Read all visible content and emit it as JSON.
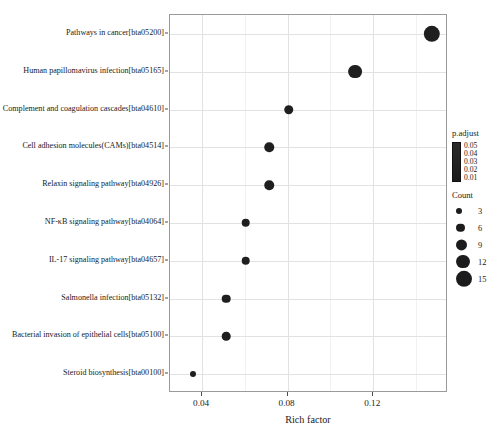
{
  "chart_data": {
    "type": "scatter",
    "title": "",
    "xlabel": "Rich factor",
    "ylabel": "",
    "xlim": [
      0.025,
      0.155
    ],
    "ylim": [
      0,
      11
    ],
    "grid": true,
    "legend_position": "right",
    "xticks": [
      0.04,
      0.08,
      0.12
    ],
    "xtick_labels": [
      "0.04",
      "0.08",
      "0.12"
    ],
    "categories": [
      "Pathways in cancer[bta05200]",
      "Human papillomavirus infection[bta05165]",
      "Complement and coagulation cascades[bta04610]",
      "Cell adhesion molecules(CAMs)[bta04514]",
      "Relaxin signaling pathway[bta04926]",
      "NF-κB signaling pathway[bta04064]",
      "IL-17 signaling pathway[bta04657]",
      "Salmonella infection[bta05132]",
      "Bacterial invasion of epithelial cells[bta05100]",
      "Steroid biosynthesis[bta00100]"
    ],
    "points": [
      {
        "category": "Pathways in cancer[bta05200]",
        "rich_factor": 0.1475,
        "count": 15,
        "p_adjust": 0.012
      },
      {
        "category": "Human papillomavirus infection[bta05165]",
        "rich_factor": 0.1115,
        "count": 12,
        "p_adjust": 0.018
      },
      {
        "category": "Complement and coagulation cascades[bta04610]",
        "rich_factor": 0.0805,
        "count": 7,
        "p_adjust": 0.014
      },
      {
        "category": "Cell adhesion molecules(CAMs)[bta04514]",
        "rich_factor": 0.0715,
        "count": 7,
        "p_adjust": 0.022
      },
      {
        "category": "Relaxin signaling pathway[bta04926]",
        "rich_factor": 0.0715,
        "count": 7,
        "p_adjust": 0.03
      },
      {
        "category": "NF-κB signaling pathway[bta04064]",
        "rich_factor": 0.0605,
        "count": 6,
        "p_adjust": 0.035
      },
      {
        "category": "IL-17 signaling pathway[bta04657]",
        "rich_factor": 0.0605,
        "count": 6,
        "p_adjust": 0.04
      },
      {
        "category": "Salmonella infection[bta05132]",
        "rich_factor": 0.0512,
        "count": 6,
        "p_adjust": 0.043
      },
      {
        "category": "Bacterial invasion of epithelial cells[bta05100]",
        "rich_factor": 0.0512,
        "count": 6,
        "p_adjust": 0.046
      },
      {
        "category": "Steroid biosynthesis[bta00100]",
        "rich_factor": 0.0355,
        "count": 3,
        "p_adjust": 0.05
      }
    ]
  },
  "axes": {
    "x_title": "Rich factor",
    "x_tick_labels": [
      "0.04",
      "0.08",
      "0.12"
    ],
    "y_tick_labels": [
      "Pathways in cancer[bta05200]",
      "Human papillomavirus infection[bta05165]",
      "Complement and coagulation cascades[bta04610]",
      "Cell adhesion molecules(CAMs)[bta04514]",
      "Relaxin signaling pathway[bta04926]",
      "NF-κB signaling pathway[bta04064]",
      "IL-17 signaling pathway[bta04657]",
      "Salmonella infection[bta05132]",
      "Bacterial invasion of epithelial cells[bta05100]",
      "Steroid biosynthesis[bta00100]"
    ]
  },
  "legends": {
    "padjust": {
      "title": "p.adjust",
      "tick_labels": [
        "0.05",
        "0.04",
        "0.03",
        "0.02",
        "0.01"
      ],
      "gradient_high_color": "#2b2b2b",
      "gradient_low_color": "#1b1b1b"
    },
    "count": {
      "title": "Count",
      "labels": [
        "3",
        "6",
        "9",
        "12",
        "15"
      ],
      "dot_color": "#1c1c1c"
    }
  },
  "style": {
    "point_color": "#1f1f1f",
    "panel_border_color": "#9a9a9a",
    "gridline_color": "#e2e2e2",
    "background": "#ffffff"
  }
}
